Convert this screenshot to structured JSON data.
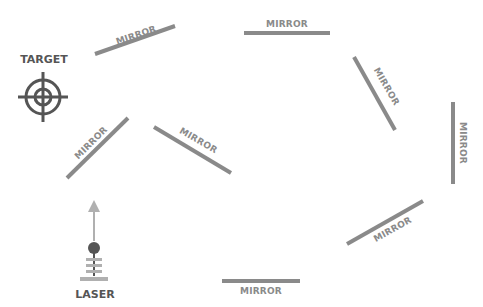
{
  "diagram": {
    "colors": {
      "mirror": "#8a8a8a",
      "dark": "#555555",
      "arrow": "#b0b0b0",
      "background": "#ffffff"
    },
    "target": {
      "label": "TARGET",
      "icon": "crosshair-target-icon"
    },
    "laser": {
      "label": "LASER",
      "icon": "laser-emitter-icon",
      "beam_direction": "up"
    },
    "mirrors": [
      {
        "label": "MIRROR",
        "position": "top-left, angled"
      },
      {
        "label": "MIRROR",
        "position": "top-center, horizontal"
      },
      {
        "label": "MIRROR",
        "position": "top-right, angled"
      },
      {
        "label": "MIRROR",
        "position": "right, vertical"
      },
      {
        "label": "MIRROR",
        "position": "bottom-right, angled"
      },
      {
        "label": "MIRROR",
        "position": "bottom-center, horizontal"
      },
      {
        "label": "MIRROR",
        "position": "left-center, angled"
      },
      {
        "label": "MIRROR",
        "position": "center, angled"
      }
    ]
  }
}
